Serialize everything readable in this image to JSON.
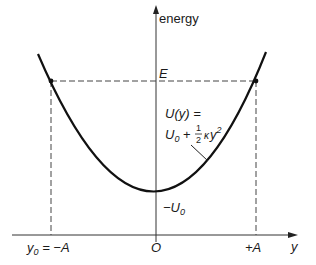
{
  "diagram": {
    "type": "potential-energy-well",
    "y_axis_label": "energy",
    "x_axis_label": "y",
    "energy_level_label": "E",
    "origin_label": "O",
    "left_turning_point_label": "y₀ = −A",
    "left_turning_point_parts": {
      "var": "y",
      "sub": "0",
      "rest": " = −A"
    },
    "right_turning_point_label": "+A",
    "minimum_label": "−U₀",
    "minimum_parts": {
      "main": "−U",
      "sub": "0"
    },
    "curve_equation_line1": "U(y) =",
    "curve_equation_line2": "U₀ + ½κy²",
    "curve_equation_parts": {
      "u": "U",
      "u_sub": "0",
      "plus": " + ",
      "num": "1",
      "den": "2",
      "kappa": "κ",
      "y": "y",
      "exp": "2"
    },
    "colors": {
      "curve": "#111111",
      "axes": "#333333",
      "dashed": "#444444",
      "text": "#1a1a1a"
    }
  }
}
